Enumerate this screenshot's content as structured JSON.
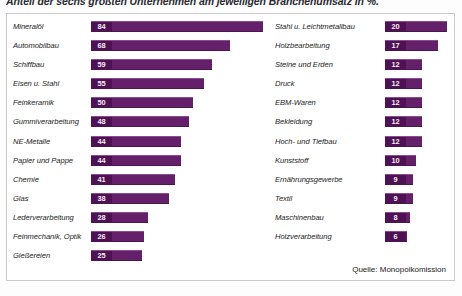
{
  "chart_data": {
    "type": "bar",
    "title": "Anteil der sechs größten Unternehmen am jeweiligen Branchenumsatz in %.",
    "xlabel": "",
    "ylabel": "",
    "xlim": [
      0,
      84
    ],
    "grid": false,
    "legend": "none",
    "orientation": "horizontal",
    "source": "Quelle: Monopolkomission",
    "categories": [
      "Mineralöl",
      "Automobilbau",
      "Schiffbau",
      "Eisen u. Stahl",
      "Feinkeramik",
      "Gummiverarbeitung",
      "NE-Metalle",
      "Papier und Pappe",
      "Chemie",
      "Glas",
      "Lederverarbeitung",
      "Feinmechanik, Optik",
      "Gießereien",
      "Stahl u. Leichtmetallbau",
      "Holzbearbeitung",
      "Steine und Erden",
      "Druck",
      "EBM-Waren",
      "Bekleidung",
      "Hoch- und Tiefbau",
      "Kunststoff",
      "Ernährungsgewerbe",
      "Textil",
      "Maschinenbau",
      "Holzverarbeitung"
    ],
    "values": [
      84,
      68,
      59,
      55,
      50,
      48,
      44,
      44,
      41,
      38,
      28,
      26,
      25,
      20,
      17,
      12,
      12,
      12,
      12,
      12,
      10,
      9,
      9,
      8,
      6
    ],
    "columns": {
      "left": [
        {
          "label": "Mineralöl",
          "value": 84
        },
        {
          "label": "Automobilbau",
          "value": 68
        },
        {
          "label": "Schiffbau",
          "value": 59
        },
        {
          "label": "Eisen u. Stahl",
          "value": 55
        },
        {
          "label": "Feinkeramik",
          "value": 50
        },
        {
          "label": "Gummiverarbeitung",
          "value": 48
        },
        {
          "label": "NE-Metalle",
          "value": 44
        },
        {
          "label": "Papier und Pappe",
          "value": 44
        },
        {
          "label": "Chemie",
          "value": 41
        },
        {
          "label": "Glas",
          "value": 38
        },
        {
          "label": "Lederverarbeitung",
          "value": 28
        },
        {
          "label": "Feinmechanik, Optik",
          "value": 26
        },
        {
          "label": "Gießereien",
          "value": 25
        }
      ],
      "right": [
        {
          "label": "Stahl u. Leichtmetallbau",
          "value": 20
        },
        {
          "label": "Holzbearbeitung",
          "value": 17
        },
        {
          "label": "Steine und Erden",
          "value": 12
        },
        {
          "label": "Druck",
          "value": 12
        },
        {
          "label": "EBM-Waren",
          "value": 12
        },
        {
          "label": "Bekleidung",
          "value": 12
        },
        {
          "label": "Hoch- und Tiefbau",
          "value": 12
        },
        {
          "label": "Kunststoff",
          "value": 10
        },
        {
          "label": "Ernährungsgewerbe",
          "value": 9
        },
        {
          "label": "Textil",
          "value": 9
        },
        {
          "label": "Maschinenbau",
          "value": 8
        },
        {
          "label": "Holzverarbeitung",
          "value": 6
        }
      ]
    },
    "colors": {
      "bar": "#65206a",
      "bar_chip": "#4e1154",
      "bar_highlight": "#8e4a93",
      "frame": "#c9c9cf",
      "text": "#1b1b22",
      "background": "#ffffff"
    },
    "scale": {
      "left_max_value": 84,
      "left_track_px": 172,
      "right_max_value": 20,
      "right_track_px": 62
    }
  }
}
